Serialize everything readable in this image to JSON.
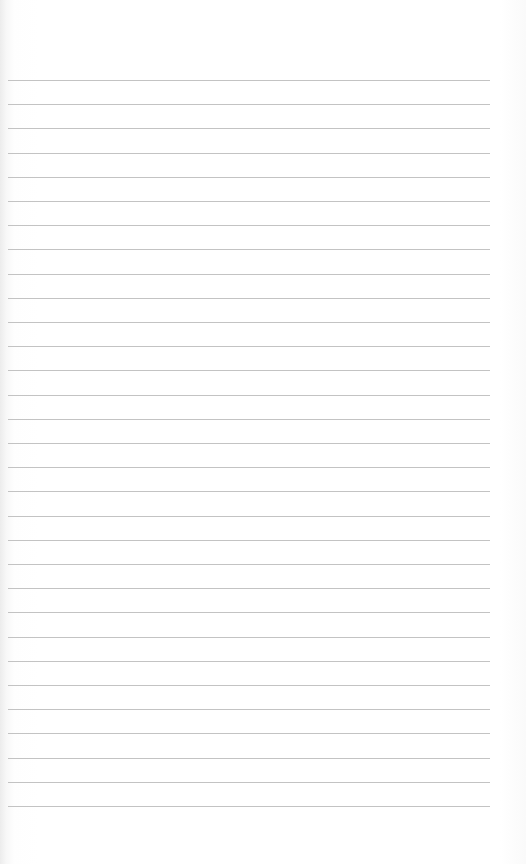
{
  "page": {
    "type": "blank-lined-paper",
    "background_color": "#ffffff",
    "rule_color": "#b8b8b8",
    "rule_count": 31,
    "first_rule_y": 80,
    "rule_spacing_px": 24.2,
    "rule_left_px": 8,
    "rule_right_px": 490
  }
}
